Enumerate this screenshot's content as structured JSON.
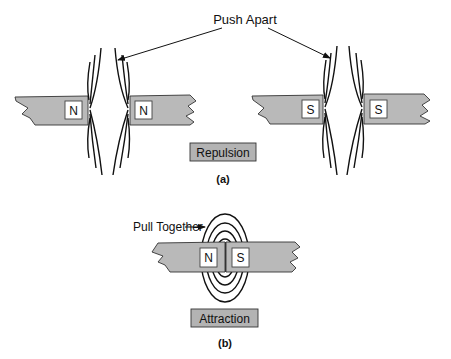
{
  "figure": {
    "part_a": {
      "callout": "Push Apart",
      "caption": "(a)",
      "label": "Repulsion",
      "left_pair": {
        "left_pole": "N",
        "right_pole": "N"
      },
      "right_pair": {
        "left_pole": "S",
        "right_pole": "S"
      }
    },
    "part_b": {
      "callout": "Pull Together",
      "caption": "(b)",
      "label": "Attraction",
      "left_pole": "N",
      "right_pole": "S"
    },
    "colors": {
      "bar_fill": "#b9b9b9",
      "label_box_fill": "#b3b3b3",
      "line": "#111111"
    }
  }
}
